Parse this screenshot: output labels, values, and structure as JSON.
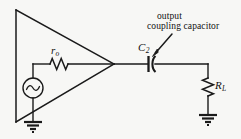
{
  "figure": {
    "background_color": "#f7f7f5",
    "line_color": "#1a1a1a",
    "width": 241,
    "height": 139
  },
  "annotation": {
    "line1": "output",
    "line2": "coupling capacitor",
    "arrow_from": [
      172,
      34
    ],
    "arrow_to": [
      152,
      56
    ],
    "points_to": "capacitor-c2"
  },
  "components": [
    {
      "id": "amplifier",
      "type": "amplifier-triangle",
      "label": "",
      "apex": [
        114,
        64
      ],
      "top_left": [
        16,
        10
      ],
      "bottom_left": [
        16,
        122
      ]
    },
    {
      "id": "source-ac",
      "type": "ac-voltage-source",
      "label": "",
      "symbol": "sine-wave",
      "center": [
        33,
        88
      ],
      "radius": 10
    },
    {
      "id": "resistor-ro",
      "type": "resistor",
      "label": "r",
      "subscript": "o",
      "orientation": "horizontal",
      "x_range": [
        50,
        68
      ],
      "y": 64
    },
    {
      "id": "capacitor-c2",
      "type": "capacitor-polarized",
      "label": "C",
      "subscript": "2",
      "x": 150,
      "y": 64
    },
    {
      "id": "resistor-rl",
      "type": "resistor",
      "label": "R",
      "subscript": "L",
      "orientation": "vertical",
      "x": 208,
      "y_range": [
        78,
        96
      ]
    },
    {
      "id": "ground-left",
      "type": "ground",
      "x": 33,
      "y": 122
    },
    {
      "id": "ground-right",
      "type": "ground",
      "x": 208,
      "y": 115
    }
  ],
  "labels": {
    "ro": {
      "main": "r",
      "sub": "o"
    },
    "c2": {
      "main": "C",
      "sub": "2"
    },
    "rl": {
      "main": "R",
      "sub": "L"
    }
  }
}
